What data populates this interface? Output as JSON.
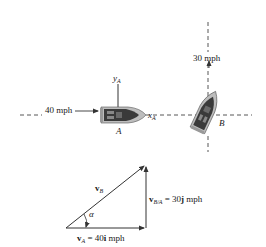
{
  "scene": {
    "speed_A_label": "40 mph",
    "speed_B_label": "30 mph",
    "boat_A_label": "A",
    "boat_B_label": "B",
    "axis_x": {
      "symbol": "x",
      "subscript": "A"
    },
    "axis_y": {
      "symbol": "y",
      "subscript": "A"
    }
  },
  "vector_triangle": {
    "vB": {
      "symbol": "v",
      "subscript": "B"
    },
    "angle": "α",
    "vA": {
      "symbol": "v",
      "subscript": "A",
      "eq": " = 40",
      "unit_vec": "i",
      "unit": " mph"
    },
    "vBA": {
      "symbol": "v",
      "subscript": "B/A",
      "eq": " = 30",
      "unit_vec": "j",
      "unit": " mph"
    }
  },
  "colors": {
    "line": "#333333",
    "boat_dark": "#3a3a3a",
    "boat_light": "#bdbdbd"
  }
}
